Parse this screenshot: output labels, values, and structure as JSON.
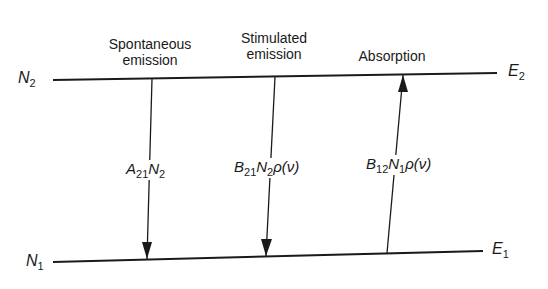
{
  "diagram": {
    "type": "energy-level-transitions",
    "levels": {
      "upper": {
        "population_label": "N",
        "population_sub": "2",
        "energy_label": "E",
        "energy_sub": "2"
      },
      "lower": {
        "population_label": "N",
        "population_sub": "1",
        "energy_label": "E",
        "energy_sub": "1"
      }
    },
    "processes": [
      {
        "name_line1": "Spontaneous",
        "name_line2": "emission",
        "direction": "down",
        "rate": {
          "coef": "A",
          "coef_sub": "21",
          "pop": "N",
          "pop_sub": "2",
          "density": ""
        }
      },
      {
        "name_line1": "Stimulated",
        "name_line2": "emission",
        "direction": "down",
        "rate": {
          "coef": "B",
          "coef_sub": "21",
          "pop": "N",
          "pop_sub": "2",
          "density": "ρ(ν)"
        }
      },
      {
        "name_line1": "",
        "name_line2": "Absorption",
        "direction": "up",
        "rate": {
          "coef": "B",
          "coef_sub": "12",
          "pop": "N",
          "pop_sub": "1",
          "density": "ρ(ν)"
        }
      }
    ],
    "colors": {
      "line": "#1a1a1a",
      "background": "#ffffff"
    }
  }
}
